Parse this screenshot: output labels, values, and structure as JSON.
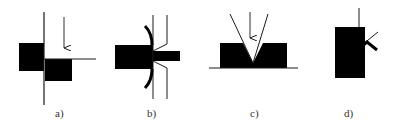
{
  "figure": {
    "panels": [
      {
        "id": "a",
        "label": "a)",
        "description": "Two offset black blocks separated by a vertical line, with a downward arrow and horizontal line"
      },
      {
        "id": "b",
        "label": "b)",
        "description": "Black block with protruding bar passing between two bent vertical lines, with curved flanges"
      },
      {
        "id": "c",
        "label": "c)",
        "description": "Black block on baseline with V-shaped notch and downward arrow"
      },
      {
        "id": "d",
        "label": "d)",
        "description": "Tall black block with vertical line on top and small bent flap on right side"
      }
    ]
  },
  "colors": {
    "fill": "#000000",
    "stroke": "#1a1a1a",
    "background": "#ffffff",
    "label": "#333333"
  }
}
